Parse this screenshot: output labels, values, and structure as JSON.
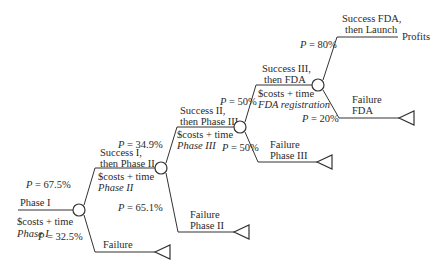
{
  "diagram": {
    "type": "decision-tree",
    "root": {
      "label": "Phase I",
      "cost_line1": "$costs + time",
      "cost_line2": "Phase I"
    },
    "nodes": [
      {
        "id": "phase1",
        "success_prob": "P = 67.5%",
        "failure_prob": "P = 32.5%",
        "success_label_1": "Success I,",
        "success_label_2": "then Phase II",
        "success_cost_1": "$costs + time",
        "success_cost_2": "Phase II",
        "failure_label_1": "Failure",
        "failure_label_2": ""
      },
      {
        "id": "phase2",
        "success_prob": "P = 34.9%",
        "failure_prob": "P = 65.1%",
        "success_label_1": "Success II,",
        "success_label_2": "then Phase III",
        "success_cost_1": "$costs + time",
        "success_cost_2": "Phase III",
        "failure_label_1": "Failure",
        "failure_label_2": "Phase II"
      },
      {
        "id": "phase3",
        "success_prob": "P = 50%",
        "failure_prob": "P = 50%",
        "success_label_1": "Success III,",
        "success_label_2": "then FDA",
        "success_cost_1": "$costs + time",
        "success_cost_2": "FDA registration",
        "failure_label_1": "Failure",
        "failure_label_2": "Phase III"
      },
      {
        "id": "fda",
        "success_prob": "P = 80%",
        "failure_prob": "P = 20%",
        "success_label_1": "Success FDA,",
        "success_label_2": "then Launch",
        "failure_label_1": "Failure",
        "failure_label_2": "FDA"
      }
    ],
    "outcome": "Profits",
    "colors": {
      "line": "#333333",
      "text": "#2a2a2a",
      "background": "#ffffff"
    }
  }
}
